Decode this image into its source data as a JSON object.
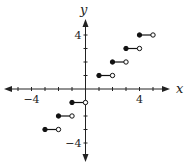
{
  "chart_data": {
    "type": "line",
    "title": "",
    "xlabel": "x",
    "ylabel": "y",
    "xlim": [
      -6,
      6
    ],
    "ylim": [
      -5,
      5
    ],
    "grid": false,
    "tick_labels": {
      "x": [
        {
          "value": -4,
          "label": "−4"
        },
        {
          "value": 4,
          "label": "4"
        }
      ],
      "y": [
        {
          "value": 4,
          "label": "4"
        },
        {
          "value": -4,
          "label": "−4"
        }
      ]
    },
    "x_ticks": [
      -5,
      -4,
      -3,
      -2,
      -1,
      1,
      2,
      3,
      4,
      5
    ],
    "y_ticks": [
      -4,
      -3,
      -2,
      -1,
      1,
      2,
      3,
      4
    ],
    "segments": [
      {
        "y": -3,
        "x_start": -3,
        "x_end": -2,
        "start": "closed",
        "end": "open"
      },
      {
        "y": -2,
        "x_start": -2,
        "x_end": -1,
        "start": "closed",
        "end": "open"
      },
      {
        "y": -1,
        "x_start": -1,
        "x_end": 0,
        "start": "closed",
        "end": "open"
      },
      {
        "y": 1,
        "x_start": 1,
        "x_end": 2,
        "start": "closed",
        "end": "open"
      },
      {
        "y": 2,
        "x_start": 2,
        "x_end": 3,
        "start": "closed",
        "end": "open"
      },
      {
        "y": 3,
        "x_start": 3,
        "x_end": 4,
        "start": "closed",
        "end": "open"
      },
      {
        "y": 4,
        "x_start": 4,
        "x_end": 5,
        "start": "closed",
        "end": "open"
      }
    ],
    "colors": {
      "axis": "#222222",
      "line": "#111111",
      "open_fill": "#ffffff"
    }
  }
}
